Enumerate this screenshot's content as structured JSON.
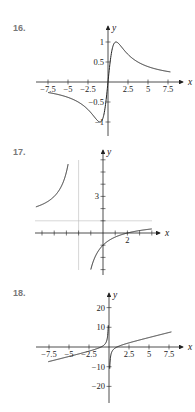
{
  "problems": [
    {
      "label": "16.",
      "top": 0
    },
    {
      "label": "17.",
      "top": 140
    },
    {
      "label": "18.",
      "top": 270
    }
  ],
  "chart_data": [
    {
      "type": "line",
      "title": "16.",
      "xlabel": "x",
      "ylabel": "y",
      "function": "y = 2x/(x^2+1)",
      "xlim": [
        -8,
        8
      ],
      "ylim": [
        -1.1,
        1.1
      ],
      "x_ticks": [
        -7.5,
        -5,
        -2.5,
        2.5,
        5,
        7.5
      ],
      "x_tick_labels": [
        "-7.5",
        "-5",
        "-2.5",
        "2.5",
        "5",
        "7.5"
      ],
      "y_ticks": [
        1,
        0.5,
        -0.5,
        -1
      ],
      "y_tick_labels": [
        "1",
        "0.5",
        "-0.5",
        "-1"
      ],
      "points": [
        [
          -7.5,
          -0.26
        ],
        [
          -5,
          -0.38
        ],
        [
          -2.5,
          -0.69
        ],
        [
          -1,
          -1
        ],
        [
          0,
          0
        ],
        [
          1,
          1
        ],
        [
          2.5,
          0.69
        ],
        [
          5,
          0.38
        ],
        [
          7.5,
          0.26
        ]
      ]
    },
    {
      "type": "line",
      "title": "17.",
      "xlabel": "x",
      "ylabel": "y",
      "function": "y = (x-2)/(x+2)",
      "vertical_asymptote": -2,
      "horizontal_asymptote": 1,
      "xlim": [
        -6,
        4
      ],
      "ylim": [
        -3,
        6
      ],
      "x_tick_labels": [
        "2"
      ],
      "y_tick_labels": [
        "3"
      ],
      "points": [
        [
          -5.5,
          2.14
        ],
        [
          -3,
          5
        ],
        [
          -2.5,
          9
        ],
        [
          -1,
          -3
        ],
        [
          0,
          -1
        ],
        [
          2,
          0
        ],
        [
          4,
          0.33
        ]
      ]
    },
    {
      "type": "line",
      "title": "18.",
      "xlabel": "x",
      "ylabel": "y",
      "function": "y = x - 1/x",
      "xlim": [
        -8,
        8
      ],
      "ylim": [
        -25,
        25
      ],
      "x_ticks": [
        -7.5,
        -5,
        -2.5,
        2.5,
        5,
        7.5
      ],
      "x_tick_labels": [
        "-7.5",
        "-5",
        "-2.5",
        "2.5",
        "5",
        "7.5"
      ],
      "y_ticks": [
        20,
        10,
        -10,
        -20
      ],
      "y_tick_labels": [
        "20",
        "10",
        "-10",
        "-20"
      ],
      "points": [
        [
          -7.5,
          -7.37
        ],
        [
          -5,
          -4.8
        ],
        [
          -2.5,
          -2.1
        ],
        [
          -0.5,
          1.5
        ],
        [
          0.5,
          -1.5
        ],
        [
          2.5,
          2.1
        ],
        [
          5,
          4.8
        ],
        [
          7.5,
          7.37
        ]
      ]
    }
  ]
}
